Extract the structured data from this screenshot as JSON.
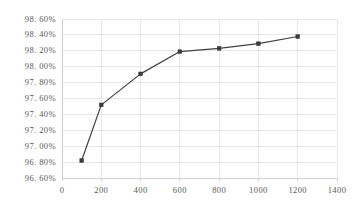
{
  "chart_data": {
    "type": "line",
    "title": "",
    "subtitle": "",
    "xlabel": "",
    "ylabel": "",
    "x": [
      100,
      200,
      400,
      600,
      800,
      1000,
      1200
    ],
    "values": [
      96.82,
      97.52,
      97.91,
      98.19,
      98.23,
      98.29,
      98.38
    ],
    "series": [
      {
        "name": "",
        "x": [
          100,
          200,
          400,
          600,
          800,
          1000,
          1200
        ],
        "values": [
          96.82,
          97.52,
          97.91,
          98.19,
          98.23,
          98.29,
          98.38
        ]
      }
    ],
    "xlim": [
      0,
      1400
    ],
    "ylim": [
      96.6,
      98.6
    ],
    "xticks": [
      0,
      200,
      400,
      600,
      800,
      1000,
      1200,
      1400
    ],
    "yticks": [
      96.6,
      96.8,
      97.0,
      97.2,
      97.4,
      97.6,
      97.8,
      98.0,
      98.2,
      98.4,
      98.6
    ],
    "xtick_labels": [
      "0",
      "200",
      "400",
      "600",
      "800",
      "1000",
      "1200",
      "1400"
    ],
    "ytick_labels": [
      "96. 60%",
      "96. 80%",
      "97. 00%",
      "97. 20%",
      "97. 40%",
      "97. 60%",
      "97. 80%",
      "98. 00%",
      "98. 20%",
      "98. 40%",
      "98. 60%"
    ],
    "grid": true,
    "grid_x": true,
    "grid_y": true,
    "legend": false,
    "legend_position": "none",
    "marker": "square",
    "line_color": "#404040",
    "marker_color": "#3a3a3a",
    "grid_color": "#e8e8ec",
    "axis_color": "#d0d0d4",
    "tick_text_color": "#5a5a5a",
    "background": "#ffffff",
    "annotations": []
  }
}
